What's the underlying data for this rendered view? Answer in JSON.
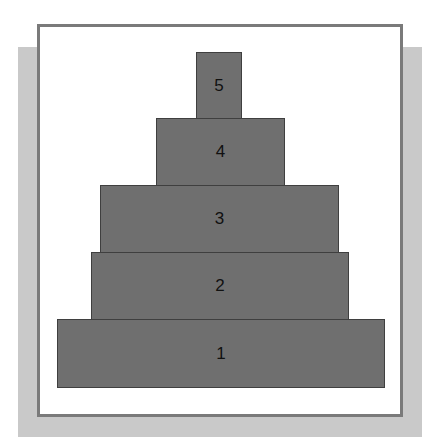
{
  "diagram": {
    "type": "stacked-pyramid",
    "colors": {
      "block_fill": "#6f6f6f",
      "block_border": "#3f3f3f",
      "frame_border": "#7a7a7a",
      "shadow": "#c9c9c9"
    },
    "levels": [
      {
        "label": "5",
        "x": 196,
        "y": 52,
        "w": 46,
        "h": 67
      },
      {
        "label": "4",
        "x": 156,
        "y": 118,
        "w": 129,
        "h": 68
      },
      {
        "label": "3",
        "x": 100,
        "y": 185,
        "w": 239,
        "h": 68
      },
      {
        "label": "2",
        "x": 91,
        "y": 252,
        "w": 258,
        "h": 68
      },
      {
        "label": "1",
        "x": 57,
        "y": 319,
        "w": 328,
        "h": 69
      }
    ]
  }
}
